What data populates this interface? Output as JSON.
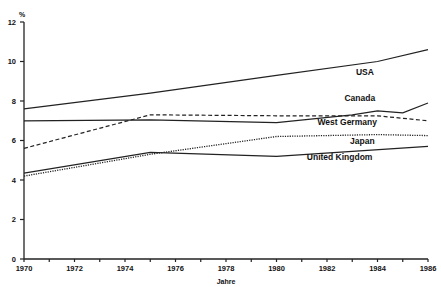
{
  "chart_data": {
    "type": "line",
    "title": "",
    "xlabel": "Jahre",
    "ylabel": "%",
    "xlim": [
      1970,
      1986
    ],
    "ylim": [
      0,
      12
    ],
    "grid": false,
    "legend": "inline labels",
    "x_ticks": [
      1970,
      1972,
      1974,
      1976,
      1978,
      1980,
      1982,
      1984,
      1986
    ],
    "x_tick_labels": [
      "1970",
      "1972",
      "1974",
      "1976",
      "1978",
      "1980",
      "1982",
      "1984",
      "1986"
    ],
    "y_ticks": [
      0,
      2,
      4,
      6,
      8,
      10,
      12
    ],
    "y_tick_labels": [
      "0",
      "2",
      "4",
      "6",
      "8",
      "10",
      "12"
    ],
    "series": [
      {
        "name": "USA",
        "style": "solid",
        "x": [
          1970,
          1975,
          1980,
          1984,
          1986
        ],
        "values": [
          7.6,
          8.4,
          9.3,
          10.0,
          10.6
        ],
        "label_pos": [
          1983.5,
          9.3
        ]
      },
      {
        "name": "Canada",
        "style": "solid",
        "x": [
          1970,
          1975,
          1980,
          1983,
          1984,
          1985,
          1986
        ],
        "values": [
          7.0,
          7.05,
          6.9,
          7.3,
          7.5,
          7.4,
          7.9
        ],
        "label_pos": [
          1983.3,
          8.0
        ]
      },
      {
        "name": "West Germany",
        "style": "dashed",
        "x": [
          1970,
          1975,
          1980,
          1984,
          1986
        ],
        "values": [
          5.6,
          7.3,
          7.25,
          7.25,
          7.0
        ],
        "label_pos": [
          1982.8,
          6.8
        ]
      },
      {
        "name": "Japan",
        "style": "dotted",
        "x": [
          1970,
          1975,
          1980,
          1984,
          1986
        ],
        "values": [
          4.2,
          5.3,
          6.2,
          6.3,
          6.25
        ],
        "label_pos": [
          1983.4,
          5.8
        ]
      },
      {
        "name": "United Kingdom",
        "style": "solid",
        "x": [
          1970,
          1975,
          1980,
          1986
        ],
        "values": [
          4.35,
          5.4,
          5.2,
          5.7
        ],
        "label_pos": [
          1982.5,
          5.0
        ]
      }
    ]
  }
}
